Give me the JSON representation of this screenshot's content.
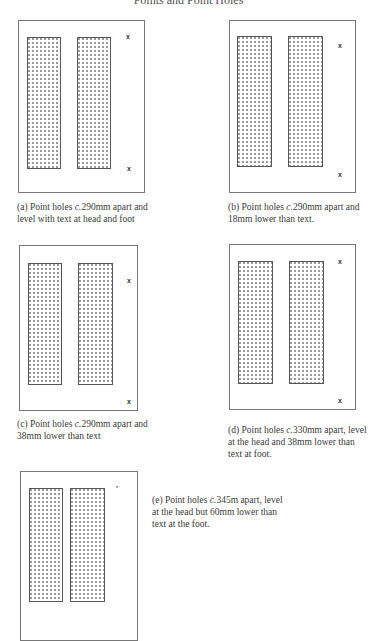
{
  "page": {
    "title": "Points and Point Holes"
  },
  "figures": [
    {
      "id": "a",
      "marks": [
        "x",
        "x"
      ],
      "caption_prefix": "(a) Point holes ",
      "caption_c": "c.",
      "caption_rest": "290mm apart and level with text at head and foot"
    },
    {
      "id": "b",
      "marks": [
        "x",
        "x"
      ],
      "caption_prefix": "(b) Point holes ",
      "caption_c": "c.",
      "caption_rest": "290mm apart and 18mm lower than text."
    },
    {
      "id": "c",
      "marks": [
        "x",
        "x"
      ],
      "caption_prefix": "(c) Point holes ",
      "caption_c": "c.",
      "caption_rest": "290mm apart and 38mm lower than text"
    },
    {
      "id": "d",
      "marks": [
        "x",
        "x"
      ],
      "caption_prefix": "(d) Point holes ",
      "caption_c": "c.",
      "caption_rest": "330mm apart, level at the head and 38mm lower than text at foot."
    },
    {
      "id": "e",
      "marks": [
        "’"
      ],
      "caption_prefix": "(e) Point holes ",
      "caption_c": "c.",
      "caption_rest": "345m apart, level at the head but 60mm lower than text at the foot."
    }
  ]
}
